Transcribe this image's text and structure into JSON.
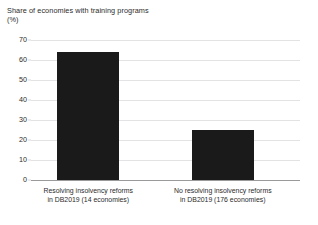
{
  "chart_data": {
    "type": "bar",
    "title": "Share of economies with training programs\n(%)",
    "title_line1": "Share of economies with training programs",
    "title_line2": "(%)",
    "xlabel": "",
    "ylabel": "(%)",
    "ylim": [
      0,
      70
    ],
    "yticks": [
      0,
      10,
      20,
      30,
      40,
      50,
      60,
      70
    ],
    "ytick_labels": [
      "0",
      "10",
      "20",
      "30",
      "40",
      "50",
      "60",
      "70"
    ],
    "grid": true,
    "legend": null,
    "bar_color": "#1a1a1a",
    "gridline_color": "#e3e2e4",
    "axis_color": "#9a9a9d",
    "background_color": "#ffffff",
    "categories": [
      "Resolving insolvency reforms\nin DB2019 (14 economies)",
      "No resolving insolvency reforms\nin DB2019 (176 economies)"
    ],
    "category_lines": [
      [
        "Resolving insolvency reforms",
        "in DB2019 (14 economies)"
      ],
      [
        "No resolving insolvency reforms",
        "in DB2019 (176 economies)"
      ]
    ],
    "values": [
      64,
      25
    ]
  }
}
